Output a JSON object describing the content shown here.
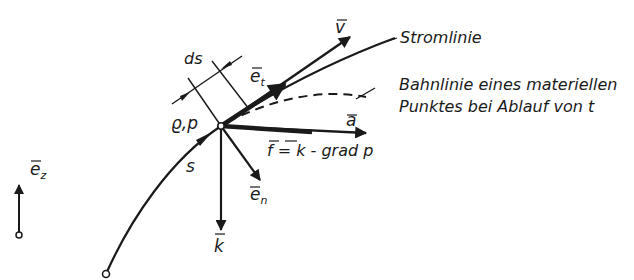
{
  "figure": {
    "labels": {
      "streamline": "Stromlinie",
      "pathline_line1": "Bahnlinie eines materiellen",
      "pathline_line2": "Punktes bei Ablauf von t",
      "ds": "ds",
      "rho_p": "ϱ,p",
      "s": "s",
      "v": "v",
      "et_base": "e",
      "et_sub": "t",
      "a": "a",
      "force_eq": "f = k - grad p",
      "en_base": "e",
      "en_sub": "n",
      "k": "k",
      "ez_base": "e",
      "ez_sub": "z"
    },
    "colors": {
      "ink": "#1a1a1a",
      "background": "#ffffff"
    }
  }
}
